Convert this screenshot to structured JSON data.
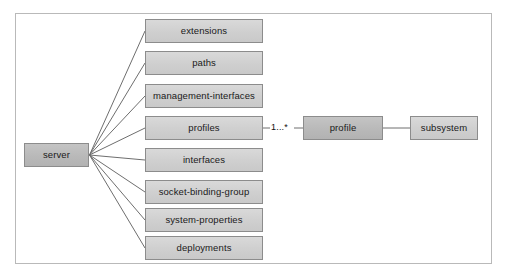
{
  "diagram": {
    "type": "entity-relationship",
    "frame": {
      "visible": true
    },
    "root": {
      "id": "server",
      "label": "server",
      "style": "dark",
      "x": 24,
      "y": 143,
      "w": 65,
      "h": 24
    },
    "children": [
      {
        "id": "extensions",
        "label": "extensions",
        "style": "light",
        "x": 145,
        "y": 19,
        "w": 118,
        "h": 24
      },
      {
        "id": "paths",
        "label": "paths",
        "style": "light",
        "x": 145,
        "y": 51,
        "w": 118,
        "h": 24
      },
      {
        "id": "management-interfaces",
        "label": "management-interfaces",
        "style": "light",
        "x": 145,
        "y": 84,
        "w": 118,
        "h": 24
      },
      {
        "id": "profiles",
        "label": "profiles",
        "style": "light",
        "x": 145,
        "y": 116,
        "w": 118,
        "h": 24
      },
      {
        "id": "interfaces",
        "label": "interfaces",
        "style": "light",
        "x": 145,
        "y": 148,
        "w": 118,
        "h": 24
      },
      {
        "id": "socket-binding-group",
        "label": "socket-binding-group",
        "style": "light",
        "x": 145,
        "y": 180,
        "w": 118,
        "h": 24
      },
      {
        "id": "system-properties",
        "label": "system-properties",
        "style": "light",
        "x": 145,
        "y": 208,
        "w": 118,
        "h": 24
      },
      {
        "id": "deployments",
        "label": "deployments",
        "style": "light",
        "x": 145,
        "y": 236,
        "w": 118,
        "h": 24
      }
    ],
    "related": [
      {
        "id": "profile",
        "label": "profile",
        "style": "dark",
        "x": 303,
        "y": 116,
        "w": 80,
        "h": 24
      },
      {
        "id": "subsystem",
        "label": "subsystem",
        "style": "light",
        "x": 410,
        "y": 116,
        "w": 68,
        "h": 24
      }
    ],
    "edge_labels": [
      {
        "id": "profiles-to-profile-multiplicity",
        "text": "1...*",
        "x": 271,
        "y": 123
      }
    ],
    "colors": {
      "frame_border": "#b9b9b9",
      "node_border": "#8c8c8c",
      "node_light_fill": "#d2d2d2",
      "node_dark_fill": "#bcbcbc",
      "connector_line": "#6e6e6e",
      "text": "#1a1a1a",
      "background": "#ffffff"
    }
  }
}
